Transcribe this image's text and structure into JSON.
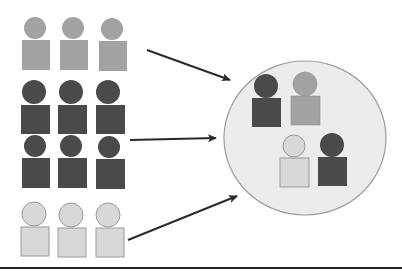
{
  "diagram": {
    "colors": {
      "medium": "#a2a2a2",
      "dark": "#4a4a4a",
      "light": "#d8d8d8",
      "light_stroke": "#9a9a9a",
      "circle_fill": "#ececec",
      "circle_stroke": "#9c9c9c",
      "arrow": "#2a2a2a",
      "baseline": "#222222"
    },
    "groups": [
      {
        "name": "medium-group",
        "shade": "medium",
        "count": 3
      },
      {
        "name": "dark-group",
        "shade": "dark",
        "count": 6
      },
      {
        "name": "light-group",
        "shade": "light",
        "count": 3
      }
    ],
    "sample_circle": {
      "members": [
        {
          "shade": "dark"
        },
        {
          "shade": "medium"
        },
        {
          "shade": "light"
        },
        {
          "shade": "dark"
        }
      ]
    },
    "arrows": [
      {
        "from": "medium-group",
        "to": "sample-circle"
      },
      {
        "from": "dark-group",
        "to": "sample-circle"
      },
      {
        "from": "light-group",
        "to": "sample-circle"
      }
    ]
  }
}
